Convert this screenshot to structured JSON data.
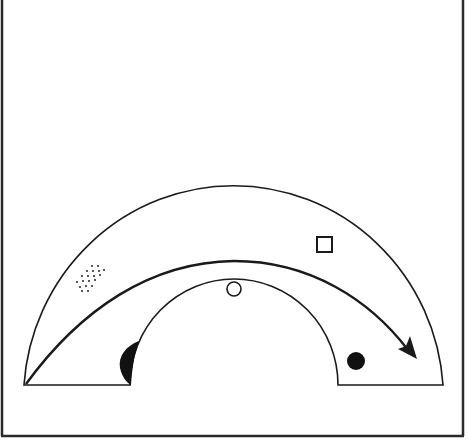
{
  "diagram": {
    "type": "half-annulus-path",
    "colors": {
      "stroke": "#1a1a1a",
      "fill_dark": "#111111",
      "background": "#ffffff",
      "frame": "#2a2a2a"
    },
    "frame": {
      "left": 2,
      "right": 463,
      "bottom": 436
    },
    "outer_arc": {
      "cx": 234,
      "cy": 384,
      "rx": 210,
      "ry": 214
    },
    "inner_arc": {
      "cx": 234,
      "cy": 384,
      "rx": 104,
      "ry": 106
    },
    "markers": [
      {
        "name": "dotted-patch",
        "shape": "dot-cluster",
        "x": 90,
        "y": 279
      },
      {
        "name": "open-circle",
        "shape": "circle-outline",
        "x": 234,
        "y": 289,
        "r": 7
      },
      {
        "name": "open-square",
        "shape": "square-outline",
        "x": 317,
        "y": 237,
        "size": 14
      },
      {
        "name": "filled-circle",
        "shape": "circle-filled",
        "x": 356,
        "y": 361,
        "r": 9
      },
      {
        "name": "dark-crescent",
        "shape": "half-lens-filled",
        "x": 128,
        "y": 362
      }
    ],
    "arrow": {
      "start": [
        25,
        384
      ],
      "peak": [
        234,
        261
      ],
      "end": [
        416,
        358
      ]
    }
  }
}
